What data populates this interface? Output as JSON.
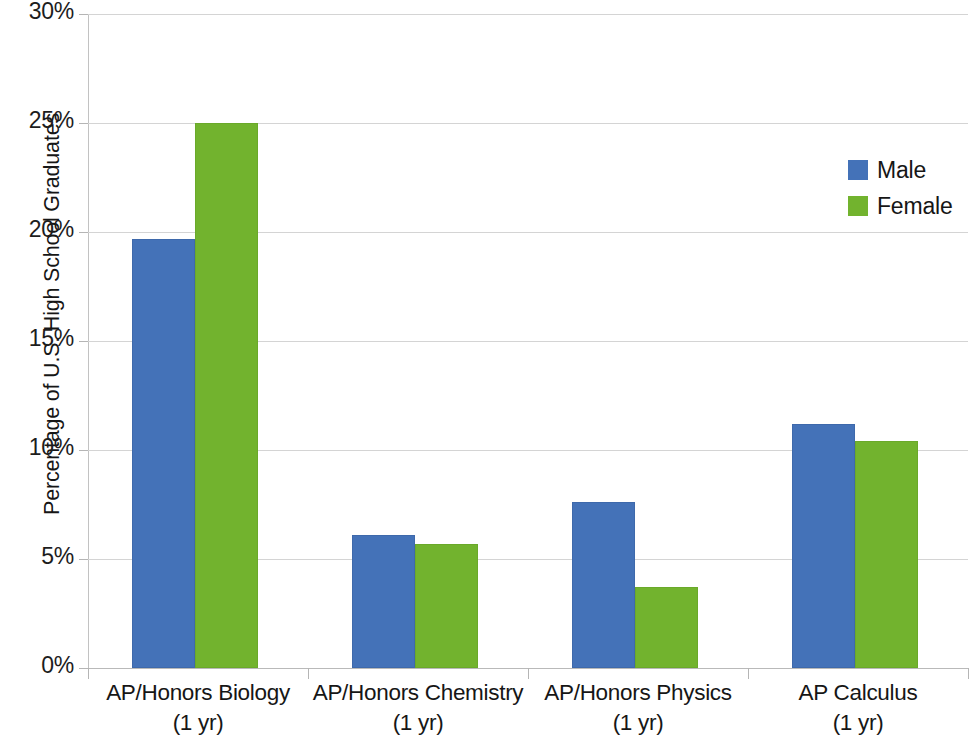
{
  "chart_data": {
    "type": "bar",
    "title": "",
    "xlabel": "",
    "ylabel": "Percentage of U.S. High School Graduates",
    "ylim": [
      0,
      30
    ],
    "ytick_labels": [
      "30%",
      "25%",
      "20%",
      "15%",
      "10%",
      "5%",
      "0%"
    ],
    "ytick_values": [
      30,
      25,
      20,
      15,
      10,
      5,
      0
    ],
    "grid": true,
    "legend_position": "right",
    "categories": [
      "AP/Honors Biology (1 yr)",
      "AP/Honors Chemistry (1 yr)",
      "AP/Honors Physics (1 yr)",
      "AP Calculus (1 yr)"
    ],
    "category_lines": [
      {
        "line1": "AP/Honors Biology",
        "line2": "(1 yr)"
      },
      {
        "line1": "AP/Honors Chemistry",
        "line2": "(1 yr)"
      },
      {
        "line1": "AP/Honors Physics",
        "line2": "(1 yr)"
      },
      {
        "line1": "AP Calculus",
        "line2": "(1 yr)"
      }
    ],
    "series": [
      {
        "name": "Male",
        "color": "#4472b8",
        "values": [
          19.7,
          6.1,
          7.6,
          11.2
        ]
      },
      {
        "name": "Female",
        "color": "#72b32e",
        "values": [
          25.0,
          5.7,
          3.7,
          10.4
        ]
      }
    ]
  },
  "legend": {
    "items": [
      {
        "label": "Male",
        "color": "#4472b8"
      },
      {
        "label": "Female",
        "color": "#72b32e"
      }
    ]
  },
  "colors": {
    "male": "#4472b8",
    "female": "#72b32e",
    "gridline": "#d4d4d4",
    "axis": "#b9b9b9",
    "background": "#ffffff",
    "text": "#161616"
  }
}
